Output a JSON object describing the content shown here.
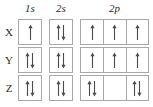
{
  "diagram": {
    "column_headers": [
      {
        "label": "1s",
        "orbital": "1s",
        "boxes": 1
      },
      {
        "label": "2s",
        "orbital": "2s",
        "boxes": 1
      },
      {
        "label": "2p",
        "orbital": "2p",
        "boxes": 3
      }
    ],
    "rows": [
      {
        "label": "X",
        "orbitals": {
          "s1": [
            "up"
          ],
          "s2": [
            "up",
            "down"
          ],
          "p2": [
            [
              "up"
            ],
            [
              "up"
            ],
            [
              "up"
            ]
          ]
        }
      },
      {
        "label": "Y",
        "orbitals": {
          "s1": [
            "up",
            "down"
          ],
          "s2": [
            "up",
            "down"
          ],
          "p2": [
            [
              "up"
            ],
            [
              "up"
            ],
            [
              "up"
            ]
          ]
        }
      },
      {
        "label": "Z",
        "orbitals": {
          "s1": [
            "up",
            "down"
          ],
          "s2": [
            "up",
            "down"
          ],
          "p2": [
            [
              "up",
              "down"
            ],
            [],
            [
              "up",
              "down"
            ]
          ]
        }
      }
    ],
    "colors": {
      "background": "#ffffff",
      "box_border": "#a8a8a8",
      "arrow": "#4a4a4a",
      "text": "#2b2b2b"
    }
  }
}
